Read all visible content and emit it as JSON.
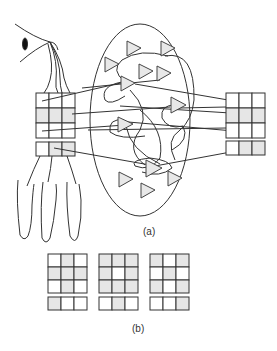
{
  "figure": {
    "panel_a": {
      "caption": "(a)",
      "elements": [
        "eye",
        "hand",
        "left-input-grid-3x3-plus-row",
        "ellipse-network-of-triangle-neurons",
        "right-output-grid-3x3-plus-row"
      ]
    },
    "panel_b": {
      "caption": "(b)",
      "grids": [
        {
          "rows": [
            [
              0,
              1,
              0
            ],
            [
              1,
              1,
              1
            ],
            [
              0,
              1,
              0
            ]
          ],
          "bottom": [
            1,
            0,
            0
          ]
        },
        {
          "rows": [
            [
              1,
              1,
              1
            ],
            [
              1,
              0,
              1
            ],
            [
              1,
              1,
              1
            ]
          ],
          "bottom": [
            0,
            1,
            0
          ]
        },
        {
          "rows": [
            [
              1,
              0,
              1
            ],
            [
              0,
              1,
              0
            ],
            [
              1,
              0,
              1
            ]
          ],
          "bottom": [
            0,
            0,
            1
          ]
        }
      ]
    },
    "colors": {
      "stroke": "#333333",
      "shade": "#e6e6e6",
      "triangle_fill": "#e8e8e8"
    }
  }
}
